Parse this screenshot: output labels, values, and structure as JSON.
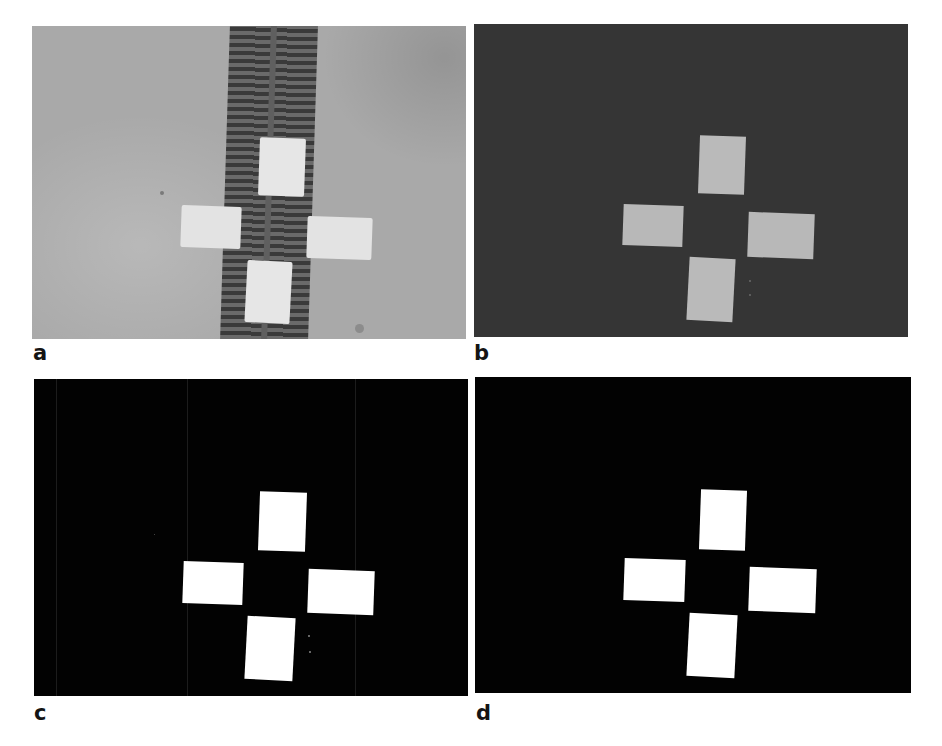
{
  "figure": {
    "panels": [
      {
        "id": "a",
        "label": "a",
        "description": "grayscale photo of four white rectangular markers arranged in a cross over a dark slatted strip",
        "background_color": "#a9a9a9",
        "patch_color": "#e4e4e4",
        "strip_color": "#3a3a3a"
      },
      {
        "id": "b",
        "label": "b",
        "description": "segmented image: gray markers on dark background",
        "background_color": "#353535",
        "patch_color": "#b9b9b9"
      },
      {
        "id": "c",
        "label": "c",
        "description": "binary mask: white markers on black with faint column artifacts",
        "background_color": "#020202",
        "patch_color": "#ffffff"
      },
      {
        "id": "d",
        "label": "d",
        "description": "cleaned binary mask: white markers on black",
        "background_color": "#020202",
        "patch_color": "#ffffff"
      }
    ]
  }
}
